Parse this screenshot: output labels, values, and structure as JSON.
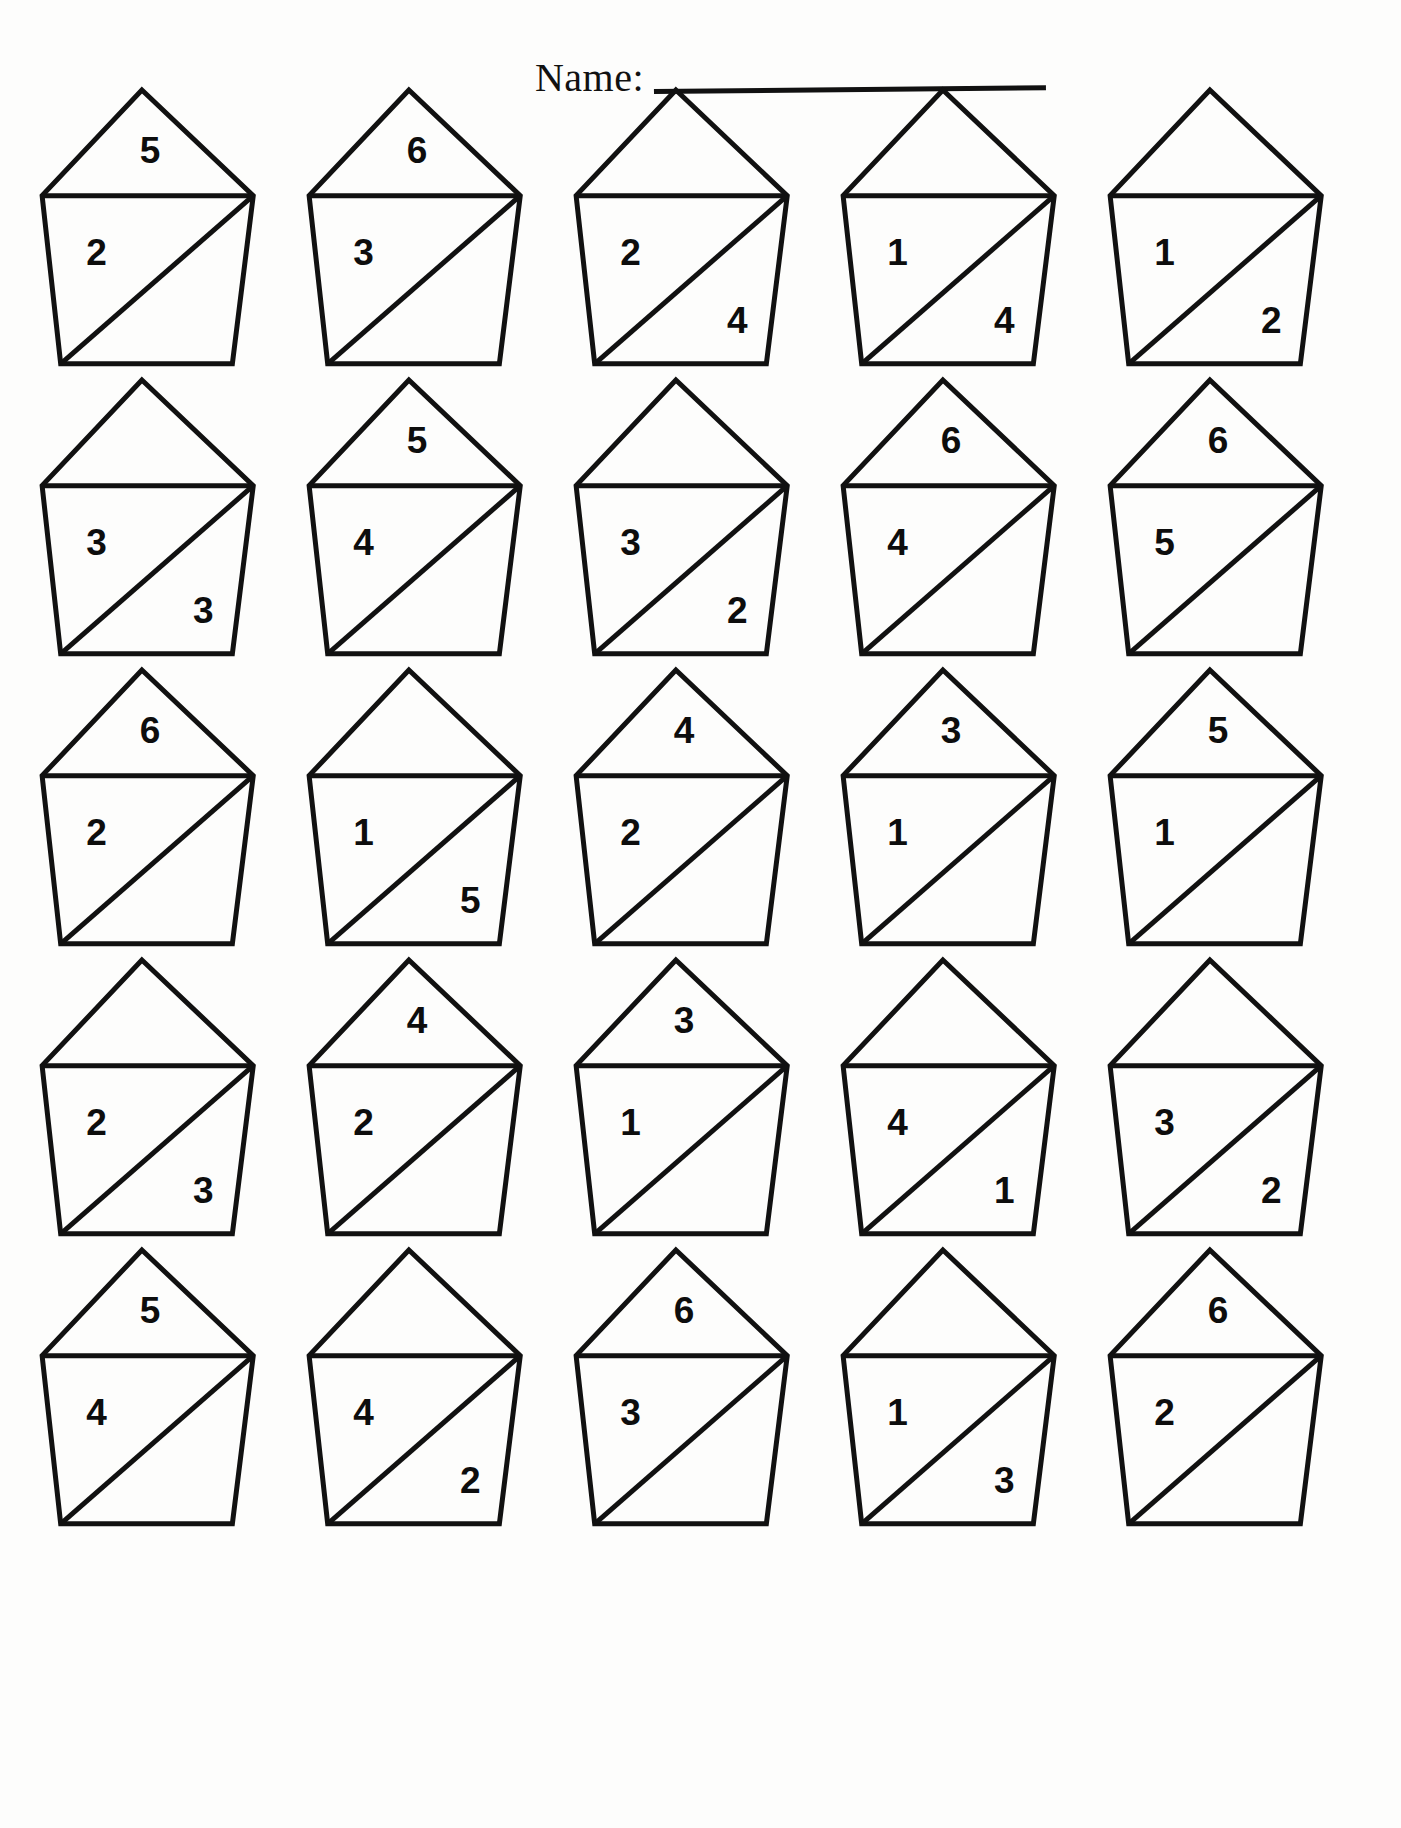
{
  "header": {
    "name_label": "Name:",
    "name_value": ""
  },
  "worksheet": {
    "rows": 5,
    "columns": 5,
    "shape": "pentagon-house",
    "ink_color": "#111111",
    "paper_color": "#fdfdfc"
  },
  "houses": [
    {
      "id": "r1c1",
      "top": "5",
      "left": "2",
      "right": ""
    },
    {
      "id": "r1c2",
      "top": "6",
      "left": "3",
      "right": ""
    },
    {
      "id": "r1c3",
      "top": "",
      "left": "2",
      "right": "4"
    },
    {
      "id": "r1c4",
      "top": "",
      "left": "1",
      "right": "4"
    },
    {
      "id": "r1c5",
      "top": "",
      "left": "1",
      "right": "2"
    },
    {
      "id": "r2c1",
      "top": "",
      "left": "3",
      "right": "3"
    },
    {
      "id": "r2c2",
      "top": "5",
      "left": "4",
      "right": ""
    },
    {
      "id": "r2c3",
      "top": "",
      "left": "3",
      "right": "2"
    },
    {
      "id": "r2c4",
      "top": "6",
      "left": "4",
      "right": ""
    },
    {
      "id": "r2c5",
      "top": "6",
      "left": "5",
      "right": ""
    },
    {
      "id": "r3c1",
      "top": "6",
      "left": "2",
      "right": ""
    },
    {
      "id": "r3c2",
      "top": "",
      "left": "1",
      "right": "5"
    },
    {
      "id": "r3c3",
      "top": "4",
      "left": "2",
      "right": ""
    },
    {
      "id": "r3c4",
      "top": "3",
      "left": "1",
      "right": ""
    },
    {
      "id": "r3c5",
      "top": "5",
      "left": "1",
      "right": ""
    },
    {
      "id": "r4c1",
      "top": "",
      "left": "2",
      "right": "3"
    },
    {
      "id": "r4c2",
      "top": "4",
      "left": "2",
      "right": ""
    },
    {
      "id": "r4c3",
      "top": "3",
      "left": "1",
      "right": ""
    },
    {
      "id": "r4c4",
      "top": "",
      "left": "4",
      "right": "1"
    },
    {
      "id": "r4c5",
      "top": "",
      "left": "3",
      "right": "2"
    },
    {
      "id": "r5c1",
      "top": "5",
      "left": "4",
      "right": ""
    },
    {
      "id": "r5c2",
      "top": "",
      "left": "4",
      "right": "2"
    },
    {
      "id": "r5c3",
      "top": "6",
      "left": "3",
      "right": ""
    },
    {
      "id": "r5c4",
      "top": "",
      "left": "1",
      "right": "3"
    },
    {
      "id": "r5c5",
      "top": "6",
      "left": "2",
      "right": ""
    }
  ]
}
